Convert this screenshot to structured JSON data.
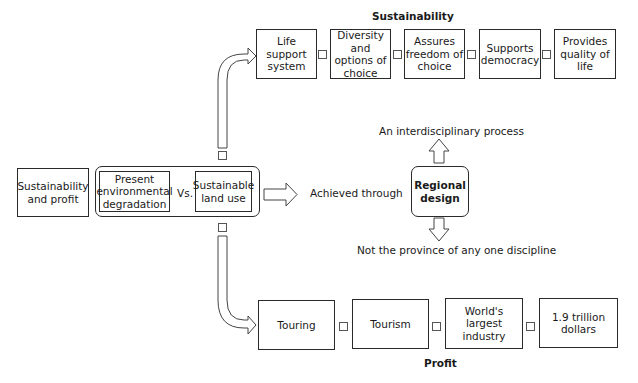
{
  "sustainability": {
    "title": "Sustainability",
    "boxes": [
      {
        "label": "Life support system"
      },
      {
        "label": "Diversity and options of choice"
      },
      {
        "label": "Assures freedom of choice"
      },
      {
        "label": "Supports democracy"
      },
      {
        "label": "Provides quality of life"
      }
    ]
  },
  "left": {
    "origin_box": "Sustainability and profit",
    "present_box": "Present environmental degradation",
    "versus": "Vs.",
    "sustainable_box": "Sustainable land use"
  },
  "center": {
    "achieved_label": "Achieved through",
    "regional_design": "Regional design",
    "up_label": "An interdisciplinary process",
    "down_label": "Not the province of any one discipline"
  },
  "profit": {
    "title": "Profit",
    "boxes": [
      {
        "label": "Touring"
      },
      {
        "label": "Tourism"
      },
      {
        "label": "World's largest industry"
      },
      {
        "label": "1.9 trillion dollars"
      }
    ]
  }
}
